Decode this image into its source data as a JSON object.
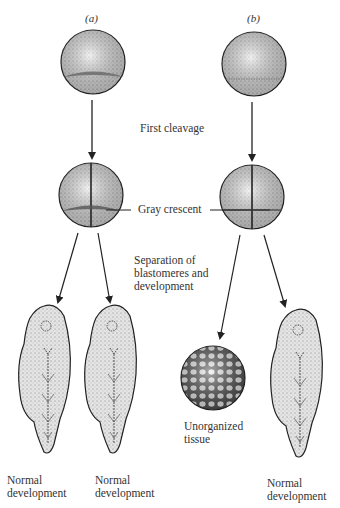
{
  "panels": {
    "a": {
      "label": "(a)"
    },
    "b": {
      "label": "(b)"
    }
  },
  "labels": {
    "first_cleavage": "First cleavage",
    "gray_crescent": "Gray crescent",
    "separation_line1": "Separation of",
    "separation_line2": "blastomeres and",
    "separation_line3": "development",
    "unorganized_line1": "Unorganized",
    "unorganized_line2": "tissue"
  },
  "outcomes": [
    {
      "line1": "Normal",
      "line2": "development"
    },
    {
      "line1": "Normal",
      "line2": "development"
    },
    {
      "line1": "Normal",
      "line2": "development"
    }
  ],
  "colors": {
    "line": "#222222",
    "fill": "#e2e2e2",
    "stipple": "#555555"
  }
}
